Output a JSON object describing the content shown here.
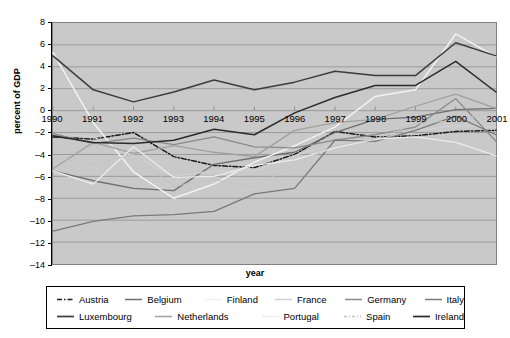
{
  "chart_data": {
    "type": "line",
    "title": "",
    "xlabel": "year",
    "ylabel": "percent of GDP",
    "x": [
      1990,
      1991,
      1992,
      1993,
      1994,
      1995,
      1996,
      1997,
      1998,
      1999,
      2000,
      2001
    ],
    "xticklabels": [
      "1990",
      "1991",
      "1992",
      "1993",
      "1994",
      "1995",
      "1996",
      "1997",
      "1998",
      "1999",
      "2000",
      "2001"
    ],
    "yticklabels": [
      "8",
      "6",
      "4",
      "2",
      "0",
      "-2",
      "-4",
      "-6",
      "-8",
      "-10",
      "-12",
      "-14"
    ],
    "yticks": [
      8,
      6,
      4,
      2,
      0,
      -2,
      -4,
      -6,
      -8,
      -10,
      -12,
      -14
    ],
    "ylim": [
      -14,
      8
    ],
    "xlim": [
      1990,
      2001
    ],
    "grid": "horizontal",
    "legend_position": "bottom",
    "plot_background": "#c9c9c9",
    "figure_background": "#ffffff",
    "series": [
      {
        "name": "Austria",
        "color": "#1a1a1a",
        "dash": "5,2,1.5,2",
        "width": 1.5,
        "values": [
          -2.4,
          -2.6,
          -2.0,
          -4.2,
          -5.0,
          -5.2,
          -4.0,
          -1.9,
          -2.4,
          -2.3,
          -1.9,
          -1.8
        ]
      },
      {
        "name": "Belgium",
        "color": "#6e6e6e",
        "dash": "",
        "width": 1.3,
        "values": [
          -5.5,
          -6.4,
          -7.1,
          -7.3,
          -4.9,
          -4.3,
          -3.8,
          -2.0,
          -0.8,
          -0.6,
          0.1,
          0.2
        ]
      },
      {
        "name": "Finland",
        "color": "#f2f2f2",
        "dash": "",
        "width": 1.5,
        "values": [
          5.3,
          -1.1,
          -5.6,
          -8.0,
          -6.7,
          -4.7,
          -3.2,
          -1.5,
          1.3,
          1.9,
          7.0,
          4.9
        ]
      },
      {
        "name": "France",
        "color": "#d0d0d0",
        "dash": "",
        "width": 1.3,
        "values": [
          -2.1,
          -2.4,
          -4.2,
          -6.0,
          -5.5,
          -5.5,
          -4.1,
          -3.0,
          -2.7,
          -1.8,
          -1.4,
          -1.5
        ]
      },
      {
        "name": "Germany",
        "color": "#8a8a8a",
        "dash": "",
        "width": 1.3,
        "values": [
          -2.1,
          -3.0,
          -2.5,
          -3.1,
          -2.4,
          -3.3,
          -3.4,
          -2.7,
          -2.2,
          -1.5,
          1.1,
          -2.8
        ]
      },
      {
        "name": "Italy",
        "color": "#7a7a7a",
        "dash": "",
        "width": 1.3,
        "values": [
          -11.0,
          -10.1,
          -9.6,
          -9.5,
          -9.2,
          -7.6,
          -7.1,
          -2.7,
          -2.8,
          -1.8,
          -0.5,
          -2.2
        ]
      },
      {
        "name": "Luxembourg",
        "color": "#3c3c3c",
        "dash": "",
        "width": 1.5,
        "values": [
          5.0,
          1.9,
          0.8,
          1.7,
          2.8,
          1.9,
          2.6,
          3.6,
          3.2,
          3.2,
          6.2,
          5.0
        ]
      },
      {
        "name": "Netherlands",
        "color": "#a0a0a0",
        "dash": "",
        "width": 1.3,
        "values": [
          -5.3,
          -2.9,
          -3.9,
          -3.2,
          -3.8,
          -4.2,
          -1.8,
          -1.1,
          -0.8,
          0.4,
          1.5,
          0.2
        ]
      },
      {
        "name": "Portugal",
        "color": "#ececec",
        "dash": "",
        "width": 1.3,
        "values": [
          -5.5,
          -6.7,
          -3.3,
          -6.1,
          -6.0,
          -5.0,
          -4.5,
          -3.4,
          -2.6,
          -2.4,
          -2.9,
          -4.1
        ]
      },
      {
        "name": "Spain",
        "color": "#c4c4c4",
        "dash": "3,2,1,2",
        "width": 1.3,
        "values": [
          -4.3,
          -4.9,
          -4.0,
          -6.9,
          -6.3,
          -7.0,
          -4.9,
          -3.2,
          -2.6,
          -1.2,
          -0.9,
          -0.1
        ]
      },
      {
        "name": "Ireland",
        "color": "#2b2b2b",
        "dash": "",
        "width": 1.5,
        "values": [
          -2.3,
          -2.9,
          -3.0,
          -2.7,
          -1.7,
          -2.2,
          -0.2,
          1.2,
          2.3,
          2.3,
          4.5,
          1.7
        ]
      }
    ]
  },
  "legend": {
    "rows": [
      [
        "Austria",
        "Belgium",
        "Finland",
        "France",
        "Germany",
        "Italy"
      ],
      [
        "Luxembourg",
        "Netherlands",
        "Portugal",
        "Spain",
        "Ireland"
      ]
    ]
  }
}
